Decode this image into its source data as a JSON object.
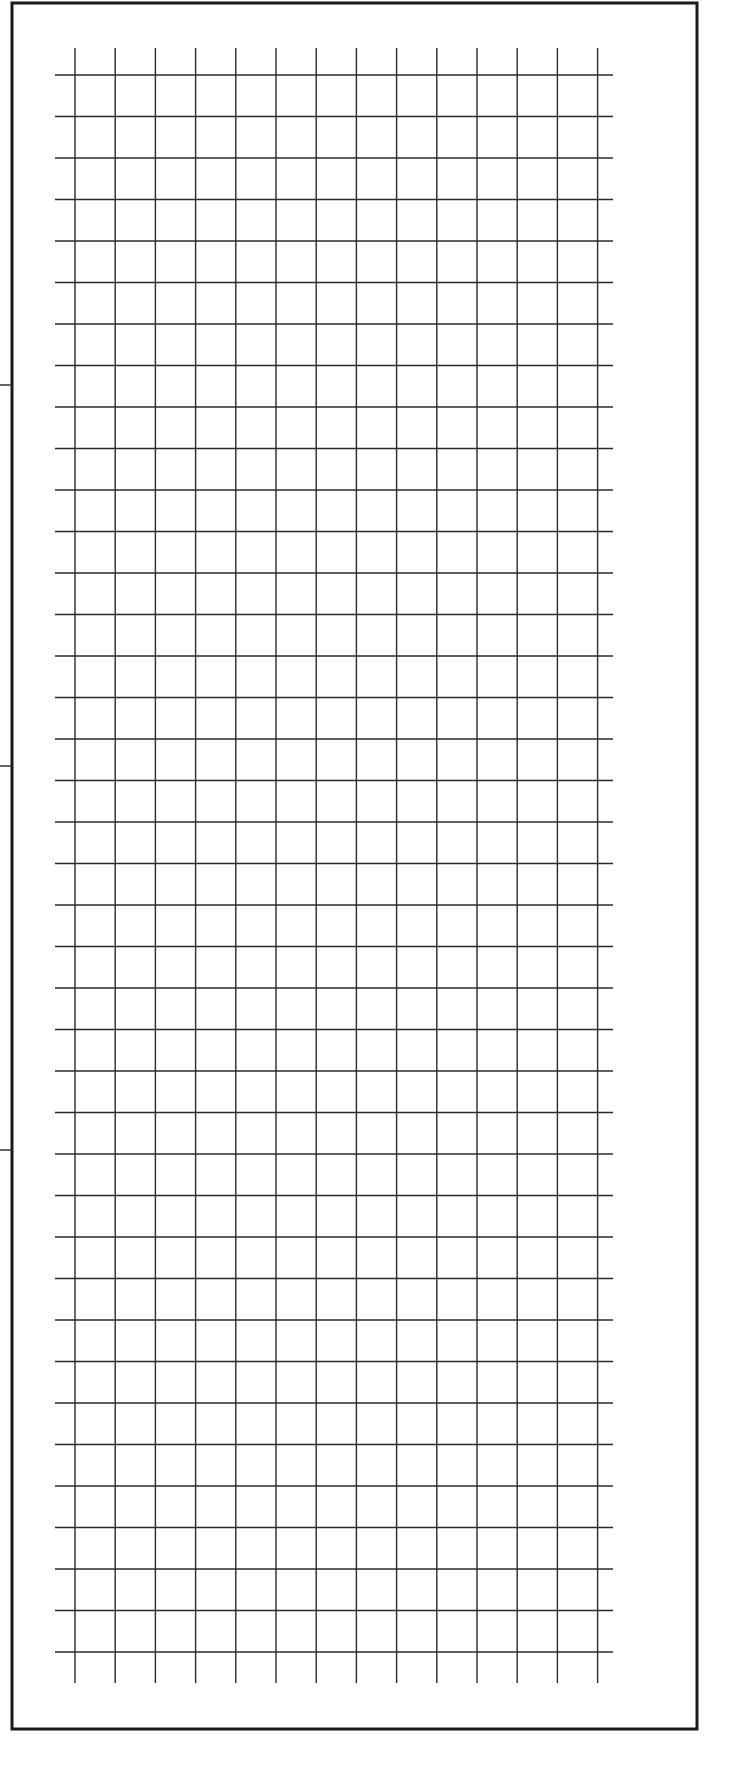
{
  "page": {
    "width": 731,
    "height": 1766,
    "background": "#ffffff"
  },
  "frame": {
    "left": 12,
    "top": 3,
    "right": 697,
    "bottom": 1729,
    "stroke": "#1a1a1a",
    "stroke_width": 3
  },
  "left_edge_ticks": {
    "y": [
      385,
      766,
      1150
    ],
    "x1": 0,
    "x2": 12,
    "stroke": "#333333"
  },
  "grid": {
    "stroke": "#2a2a2a",
    "stroke_width": 1.4,
    "vertical_lines": {
      "count": 14,
      "x_start": 75,
      "spacing": 40.2,
      "y_top": 48,
      "y_bottom": 1683
    },
    "horizontal_lines": {
      "count": 39,
      "y_start": 75,
      "spacing": 41.5,
      "x_left": 55,
      "x_right": 613
    }
  }
}
